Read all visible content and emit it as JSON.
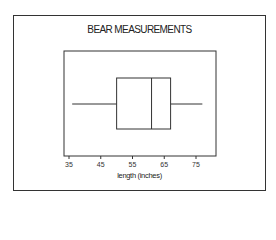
{
  "chart_data": {
    "type": "box",
    "title": "BEAR MEASUREMENTS",
    "xlabel": "length (inches)",
    "ylabel": "",
    "orientation": "horizontal",
    "xlim": [
      33,
      80
    ],
    "ticks": [
      35,
      45,
      55,
      65,
      75
    ],
    "tick_labels": [
      "35",
      "45",
      "55",
      "65",
      "75"
    ],
    "grid": false,
    "legend": null,
    "series": [
      {
        "name": "length",
        "min": 36,
        "q1": 50,
        "median": 61,
        "q3": 67,
        "max": 77
      }
    ]
  },
  "colors": {
    "line": "#333333",
    "background": "#ffffff"
  }
}
